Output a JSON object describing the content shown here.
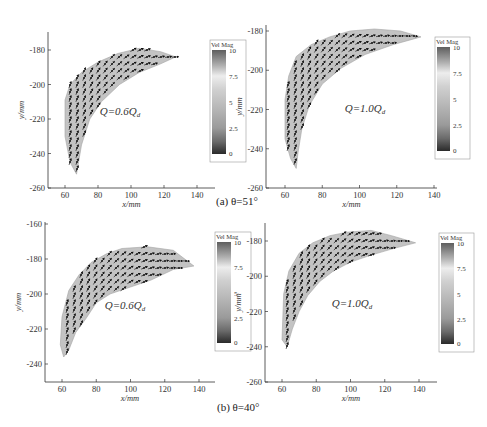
{
  "figure": {
    "captions": {
      "a": "(a) θ=51°",
      "b": "(b) θ=40°"
    }
  },
  "chart_data": [
    {
      "type": "vector-field",
      "panel": "a-left",
      "group_caption": "(a) θ=51°",
      "annotation": "Q=0.6Qd",
      "xlabel": "x/mm",
      "ylabel": "y/mm",
      "xlim": [
        50,
        150
      ],
      "ylim": [
        -260,
        -167
      ],
      "xticks": [
        60,
        80,
        100,
        120,
        140
      ],
      "yticks": [
        -180,
        -200,
        -220,
        -240,
        -260
      ],
      "colorbar": {
        "label": "Vel Mag",
        "ticks": [
          0,
          2.5,
          5,
          7.5,
          10
        ],
        "range": [
          0,
          10
        ]
      },
      "region_outline": [
        [
          60,
          -209
        ],
        [
          63,
          -200
        ],
        [
          70,
          -193
        ],
        [
          80,
          -187
        ],
        [
          92,
          -182
        ],
        [
          105,
          -179
        ],
        [
          118,
          -181
        ],
        [
          127,
          -184
        ],
        [
          118,
          -188
        ],
        [
          105,
          -193
        ],
        [
          93,
          -200
        ],
        [
          82,
          -210
        ],
        [
          75,
          -220
        ],
        [
          70,
          -235
        ],
        [
          67,
          -252
        ],
        [
          63,
          -245
        ],
        [
          60,
          -230
        ]
      ]
    },
    {
      "type": "vector-field",
      "panel": "a-right",
      "group_caption": "(a) θ=51°",
      "annotation": "Q=1.0Qd",
      "xlabel": "x/mm",
      "ylabel": "y/mm",
      "xlim": [
        50,
        140
      ],
      "ylim": [
        -260,
        -178
      ],
      "xticks": [
        60,
        80,
        100,
        120,
        140
      ],
      "yticks": [
        -180,
        -200,
        -220,
        -240,
        -260
      ],
      "colorbar": {
        "label": "Vel Mag",
        "ticks": [
          0,
          2.5,
          5,
          7.5,
          10
        ],
        "range": [
          0,
          10
        ]
      },
      "region_outline": [
        [
          60,
          -215
        ],
        [
          62,
          -203
        ],
        [
          66,
          -193
        ],
        [
          74,
          -187
        ],
        [
          84,
          -183
        ],
        [
          95,
          -180
        ],
        [
          108,
          -179
        ],
        [
          122,
          -180
        ],
        [
          133,
          -183
        ],
        [
          118,
          -187
        ],
        [
          103,
          -192
        ],
        [
          90,
          -199
        ],
        [
          80,
          -207
        ],
        [
          73,
          -218
        ],
        [
          69,
          -230
        ],
        [
          67,
          -242
        ],
        [
          66,
          -250
        ],
        [
          63,
          -245
        ],
        [
          60,
          -235
        ]
      ]
    },
    {
      "type": "vector-field",
      "panel": "b-left",
      "group_caption": "(b) θ=40°",
      "annotation": "Q=0.6Qd",
      "xlabel": "x/mm",
      "ylabel": "y/mm",
      "xlim": [
        50,
        150
      ],
      "ylim": [
        -250,
        -158
      ],
      "xticks": [
        60,
        80,
        100,
        120,
        140
      ],
      "yticks": [
        -160,
        -180,
        -200,
        -220,
        -240
      ],
      "colorbar": {
        "label": "Vel Mag",
        "ticks": [
          0,
          2.5,
          5,
          7.5,
          10
        ],
        "range": [
          0,
          10
        ]
      },
      "region_outline": [
        [
          59,
          -229
        ],
        [
          60,
          -213
        ],
        [
          64,
          -198
        ],
        [
          70,
          -189
        ],
        [
          77,
          -182
        ],
        [
          86,
          -177
        ],
        [
          95,
          -174
        ],
        [
          110,
          -173
        ],
        [
          125,
          -175
        ],
        [
          137,
          -184
        ],
        [
          125,
          -186
        ],
        [
          112,
          -192
        ],
        [
          100,
          -196
        ],
        [
          88,
          -200
        ],
        [
          80,
          -205
        ],
        [
          74,
          -214
        ],
        [
          68,
          -222
        ],
        [
          64,
          -232
        ],
        [
          61,
          -236
        ]
      ]
    },
    {
      "type": "vector-field",
      "panel": "b-right",
      "group_caption": "(b) θ=40°",
      "annotation": "Q=1.0Qd",
      "xlabel": "x/mm",
      "ylabel": "y/mm",
      "xlim": [
        50,
        150
      ],
      "ylim": [
        -260,
        -168
      ],
      "xticks": [
        60,
        80,
        100,
        120,
        140
      ],
      "yticks": [
        -180,
        -200,
        -220,
        -240,
        -260
      ],
      "colorbar": {
        "label": "Vel Mag",
        "ticks": [
          0,
          2.5,
          5,
          7.5,
          10
        ],
        "range": [
          0,
          10
        ]
      },
      "region_outline": [
        [
          60,
          -236
        ],
        [
          61,
          -210
        ],
        [
          64,
          -197
        ],
        [
          70,
          -187
        ],
        [
          78,
          -181
        ],
        [
          88,
          -177
        ],
        [
          98,
          -175
        ],
        [
          112,
          -174
        ],
        [
          124,
          -177
        ],
        [
          138,
          -181
        ],
        [
          126,
          -184
        ],
        [
          112,
          -188
        ],
        [
          100,
          -192
        ],
        [
          90,
          -197
        ],
        [
          82,
          -203
        ],
        [
          75,
          -211
        ],
        [
          70,
          -220
        ],
        [
          66,
          -230
        ],
        [
          63,
          -240
        ]
      ]
    }
  ],
  "panels": [
    {
      "id": "a-left",
      "frame": {
        "x0": 48,
        "y0": 32,
        "x1": 215,
        "y1": 188
      },
      "xmap": [
        60,
        65,
        140,
        197
      ],
      "ymap": [
        -180,
        50,
        -260,
        188
      ],
      "cbar": {
        "x": 212,
        "y": 46,
        "w": 14,
        "h": 108,
        "labelx": 207,
        "labely": 44
      },
      "annot": {
        "x": 120,
        "y": 115
      }
    },
    {
      "id": "a-right",
      "frame": {
        "x0": 266,
        "y0": 25,
        "x1": 437,
        "y1": 188
      },
      "xmap": [
        60,
        285,
        140,
        434
      ],
      "ymap": [
        -180,
        31,
        -260,
        188
      ],
      "cbar": {
        "x": 437,
        "y": 43,
        "w": 13,
        "h": 108,
        "labelx": 431,
        "labely": 41
      },
      "annot": {
        "x": 365,
        "y": 112
      }
    },
    {
      "id": "b-left",
      "frame": {
        "x0": 45,
        "y0": 222,
        "x1": 215,
        "y1": 382
      },
      "xmap": [
        60,
        62,
        140,
        199
      ],
      "ymap": [
        -160,
        224,
        -240,
        364
      ],
      "cbar": {
        "x": 217,
        "y": 238,
        "w": 14,
        "h": 105,
        "labelx": 212,
        "labely": 234
      },
      "annot": {
        "x": 125,
        "y": 309
      }
    },
    {
      "id": "b-right",
      "frame": {
        "x0": 265,
        "y0": 223,
        "x1": 437,
        "y1": 382
      },
      "xmap": [
        60,
        282,
        140,
        419
      ],
      "ymap": [
        -180,
        241,
        -260,
        382
      ],
      "cbar": {
        "x": 441,
        "y": 239,
        "w": 13,
        "h": 105,
        "labelx": 436,
        "labely": 235
      },
      "annot": {
        "x": 352,
        "y": 307
      }
    }
  ]
}
